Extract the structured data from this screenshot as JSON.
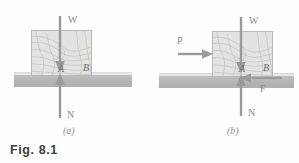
{
  "figure": {
    "caption": "Fig. 8.1",
    "subfigure_a_label": "(a)",
    "subfigure_b_label": "(b)"
  },
  "panel_a": {
    "forces": {
      "weight_label": "W",
      "normal_label": "N"
    },
    "points": {
      "a_label": "A",
      "b_label": "B"
    }
  },
  "panel_b": {
    "forces": {
      "weight_label": "W",
      "normal_label": "N",
      "applied_label": "P",
      "friction_label": "F"
    },
    "points": {
      "a_label": "A",
      "b_label": "B"
    }
  },
  "colors": {
    "arrow": "#9a9a9a",
    "block_fill": "#e2e2e0",
    "block_stroke": "#b9b9b9",
    "ground": "#b4b4b4",
    "label": "#8a8a8a",
    "caption": "#3d3d3d"
  }
}
